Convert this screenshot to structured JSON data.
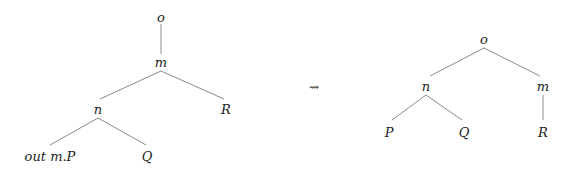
{
  "diagram": {
    "type": "tree-rewrite",
    "relation_symbol": "⇝",
    "left_tree": {
      "nodes": [
        {
          "id": "o",
          "label": "o",
          "x": 161,
          "y": 18
        },
        {
          "id": "m",
          "label": "m",
          "x": 161,
          "y": 63
        },
        {
          "id": "n",
          "label": "n",
          "x": 98,
          "y": 110
        },
        {
          "id": "R",
          "label": "R",
          "x": 227,
          "y": 110
        },
        {
          "id": "P",
          "label": "out m.P",
          "x": 50,
          "y": 157
        },
        {
          "id": "Q",
          "label": "Q",
          "x": 147,
          "y": 157
        }
      ],
      "edges": [
        [
          "o",
          "m"
        ],
        [
          "m",
          "n"
        ],
        [
          "m",
          "R"
        ],
        [
          "n",
          "P"
        ],
        [
          "n",
          "Q"
        ]
      ]
    },
    "right_tree": {
      "nodes": [
        {
          "id": "o",
          "label": "o",
          "x": 484,
          "y": 40
        },
        {
          "id": "n",
          "label": "n",
          "x": 426,
          "y": 87
        },
        {
          "id": "m",
          "label": "m",
          "x": 543,
          "y": 87
        },
        {
          "id": "P",
          "label": "P",
          "x": 389,
          "y": 132
        },
        {
          "id": "Q",
          "label": "Q",
          "x": 463,
          "y": 132
        },
        {
          "id": "R",
          "label": "R",
          "x": 543,
          "y": 132
        }
      ],
      "edges": [
        [
          "o",
          "n"
        ],
        [
          "o",
          "m"
        ],
        [
          "n",
          "P"
        ],
        [
          "n",
          "Q"
        ],
        [
          "m",
          "R"
        ]
      ]
    }
  },
  "labels": {
    "left_o": "o",
    "left_m": "m",
    "left_n": "n",
    "left_R": "R",
    "left_outmP": "out m.P",
    "left_Q": "Q",
    "arrow": "⇝",
    "right_o": "o",
    "right_n": "n",
    "right_m": "m",
    "right_P": "P",
    "right_Q": "Q",
    "right_R": "R"
  }
}
